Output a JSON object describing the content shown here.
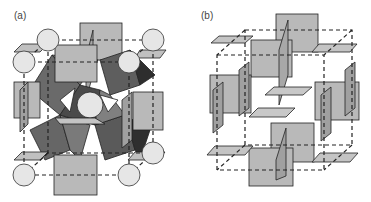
{
  "figure": {
    "panels": [
      {
        "id": "a",
        "label": "(a)",
        "description": "Corner-sharing octahedral framework with large spheres at cube corners and a central sphere, square planes on cube faces"
      },
      {
        "id": "b",
        "label": "(b)",
        "description": "Skeleton of square planes located on faces and edges of a dashed cubic cell"
      }
    ]
  },
  "colors": {
    "plane_fill": "#b9b9b9",
    "octa_dark": "#5a5a5a",
    "octa_mid": "#7a7a7a",
    "octa_darkest": "#2e2e2e",
    "sphere_fill": "#e6e6e6",
    "line": "#222222"
  }
}
